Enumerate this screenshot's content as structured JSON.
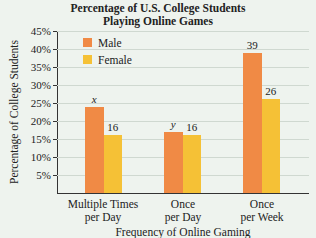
{
  "title_line1": "Percentage of U.S. College Students",
  "title_line2": "Playing Online Games",
  "ylabel": "Percentage of College Students",
  "xlabel": "Frequency of Online Gaming",
  "yticks": [
    "5%",
    "10%",
    "15%",
    "20%",
    "25%",
    "30%",
    "35%",
    "40%",
    "45%"
  ],
  "legend": [
    {
      "label": "Male",
      "color": "#f08a45"
    },
    {
      "label": "Female",
      "color": "#f5c136"
    }
  ],
  "categories": [
    {
      "line1": "Multiple Times",
      "line2": "per Day"
    },
    {
      "line1": "Once",
      "line2": "per Day"
    },
    {
      "line1": "Once",
      "line2": "per Week"
    }
  ],
  "bar_labels": {
    "male": [
      "x",
      "y",
      "39"
    ],
    "female": [
      "16",
      "16",
      "26"
    ]
  },
  "chart_data": {
    "type": "bar",
    "title": "Percentage of U.S. College Students Playing Online Games",
    "xlabel": "Frequency of Online Gaming",
    "ylabel": "Percentage of College Students",
    "categories": [
      "Multiple Times per Day",
      "Once per Day",
      "Once per Week"
    ],
    "series": [
      {
        "name": "Male",
        "values": [
          24,
          17,
          39
        ],
        "labels": [
          "x",
          "y",
          "39"
        ],
        "color": "#f08a45"
      },
      {
        "name": "Female",
        "values": [
          16,
          16,
          26
        ],
        "labels": [
          "16",
          "16",
          "26"
        ],
        "color": "#f5c136"
      }
    ],
    "ylim": [
      0,
      45
    ],
    "yticks": [
      5,
      10,
      15,
      20,
      25,
      30,
      35,
      40,
      45
    ],
    "ytick_format": "percent",
    "grid": true,
    "legend_position": "upper left"
  }
}
